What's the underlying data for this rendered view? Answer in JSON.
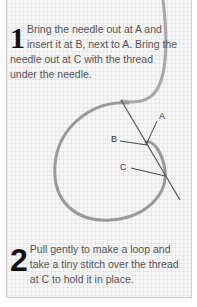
{
  "steps": [
    {
      "number": "1",
      "text": "Bring the needle out at A and insert it at B, next to A. Bring the needle out at C with the thread under the needle."
    },
    {
      "number": "2",
      "text": "Pull gently to make a loop and take a tiny stitch over the thread at C to hold it in place."
    }
  ],
  "diagram": {
    "labels": {
      "a": "A",
      "b": "B",
      "c": "C"
    },
    "thread_color": "#9a9a9a",
    "needle_color": "#555555"
  }
}
